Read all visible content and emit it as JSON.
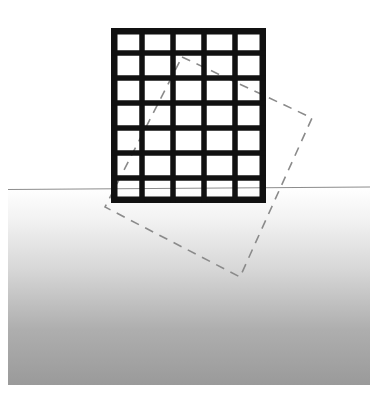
{
  "figure": {
    "canvas": {
      "width": 377,
      "height": 395,
      "background": "#ffffff"
    },
    "colors": {
      "grid_stroke": "#111111",
      "horizon_line": "#8d8d8d",
      "dashed_outline": "#8a8a8a",
      "ground_top": "#ffffff",
      "ground_bottom": "#9a9a9a",
      "page_background": "#ffffff"
    },
    "ground_plane": {
      "name": "ground-gradient",
      "x": 8,
      "y": 188,
      "width": 362,
      "height": 197,
      "gradient_from": "#ffffff",
      "gradient_to": "#9a9a9a",
      "gradient_direction": "vertical"
    },
    "horizon": {
      "name": "horizon-line",
      "x1": 8,
      "y1": 189.5,
      "x2": 370,
      "y2": 187.0,
      "stroke_width": 1.2,
      "color": "#8d8d8d"
    },
    "grid_panel": {
      "name": "solid-grid-panel",
      "x": 111,
      "y": 28,
      "width": 155,
      "height": 175,
      "columns": 5,
      "rows": 7,
      "stroke_width": 5.5,
      "outer_stroke_width": 6.5,
      "color": "#111111"
    },
    "dashed_outline": {
      "name": "dashed-rotated-outline",
      "label": "rotated position outline",
      "points": [
        {
          "x": 182,
          "y": 57
        },
        {
          "x": 312,
          "y": 118
        },
        {
          "x": 240,
          "y": 277
        },
        {
          "x": 105,
          "y": 207
        }
      ],
      "stroke_width": 1.6,
      "dash_pattern": "9 7",
      "color": "#8a8a8a"
    }
  },
  "chart_data": {
    "type": "diagram",
    "shapes": [
      {
        "name": "grid-panel",
        "kind": "rectangle-grid",
        "columns": 5,
        "rows": 7,
        "bounds": {
          "x": 111,
          "y": 28,
          "width": 155,
          "height": 175
        }
      },
      {
        "name": "dashed-outline",
        "kind": "quadrilateral",
        "vertices": [
          [
            182,
            57
          ],
          [
            312,
            118
          ],
          [
            240,
            277
          ],
          [
            105,
            207
          ]
        ]
      },
      {
        "name": "horizon",
        "kind": "line",
        "from": [
          8,
          189.5
        ],
        "to": [
          370,
          187.0
        ]
      },
      {
        "name": "ground",
        "kind": "gradient-rectangle",
        "bounds": {
          "x": 8,
          "y": 188,
          "width": 362,
          "height": 197
        }
      }
    ]
  }
}
